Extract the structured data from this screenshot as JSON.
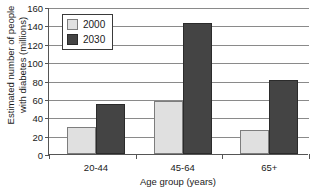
{
  "chart_data": {
    "type": "bar",
    "title": "",
    "xlabel": "Age group (years)",
    "ylabel_line1": "Estimated number of people",
    "ylabel_line2": "with diabetes (millions)",
    "categories": [
      "20-44",
      "45-64",
      "65+"
    ],
    "series": [
      {
        "name": "2000",
        "values": [
          29,
          58,
          26
        ],
        "color": "#e0e0e0"
      },
      {
        "name": "2030",
        "values": [
          54,
          143,
          81
        ],
        "color": "#444444"
      }
    ],
    "ylim": [
      0,
      160
    ],
    "ytick_step": 20,
    "yticks": [
      "0",
      "20",
      "40",
      "60",
      "80",
      "100",
      "120",
      "140",
      "160"
    ],
    "grid": true,
    "legend_position": "upper-left-inside"
  },
  "legend": {
    "items": [
      {
        "label": "2000"
      },
      {
        "label": "2030"
      }
    ]
  }
}
